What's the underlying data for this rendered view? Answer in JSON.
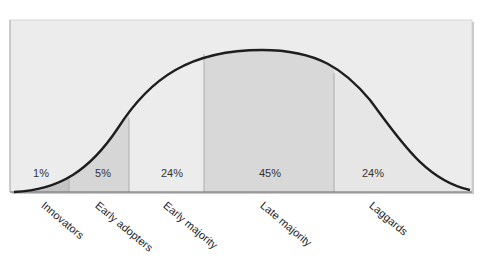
{
  "diagram": {
    "type": "diffusion-of-innovations-bell-curve",
    "colors": {
      "background_box": "#ececec",
      "box_edge": "#bdbdbd",
      "curve": "#1e1e1e",
      "divider": "#a8a8a8",
      "innovators_fill": "#c4c4c4",
      "early_adopters_fill": "#d6d6d6",
      "early_majority_fill": "#ececec",
      "late_majority_fill": "#d8d8d8",
      "laggards_fill": "#e6e6e6"
    },
    "segments": [
      {
        "name": "Innovators",
        "percent": "1%",
        "x_start": 10,
        "x_end": 69
      },
      {
        "name": "Early adopters",
        "percent": "5%",
        "x_start": 69,
        "x_end": 129
      },
      {
        "name": "Early majority",
        "percent": "24%",
        "x_start": 129,
        "x_end": 204
      },
      {
        "name": "Late majority",
        "percent": "45%",
        "x_start": 204,
        "x_end": 334
      },
      {
        "name": "Laggards",
        "percent": "24%",
        "x_start": 334,
        "x_end": 472
      }
    ]
  }
}
